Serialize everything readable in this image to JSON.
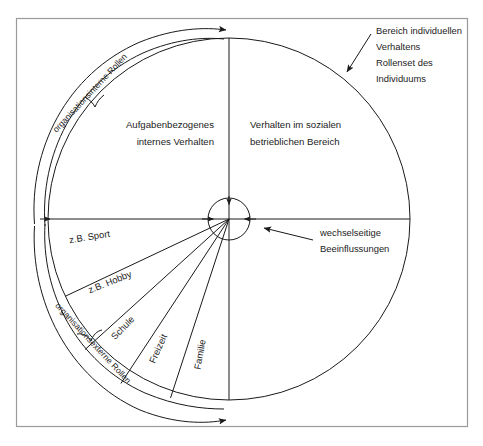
{
  "diagram": {
    "title_visible": false,
    "frame": {
      "present": true,
      "color": "#9a9a9a"
    },
    "line_color": "#1a1a1a",
    "background": "#ffffff",
    "quadrants": {
      "top_left": {
        "line1": "Aufgabenbezogenes",
        "line2": "internes Verhalten"
      },
      "top_right": {
        "line1": "Verhalten im sozialen",
        "line2": "betrieblichen Bereich"
      }
    },
    "callout_individual": {
      "line1": "Bereich individuellen",
      "line2": "Verhaltens",
      "line3": "Rollenset des",
      "line4": "Individuums"
    },
    "callout_center": {
      "line1": "wechselseitige",
      "line2": "Beeinflussungen"
    },
    "arc_brackets": [
      {
        "id": "internal",
        "label": "organisationsinterne Rollen"
      },
      {
        "id": "external",
        "label": "organisationsexterne Rollen"
      }
    ],
    "segments": [
      {
        "label": "z.B. Sport"
      },
      {
        "label": "z.B. Hobby"
      },
      {
        "label": "Schule"
      },
      {
        "label": "Freizeit"
      },
      {
        "label": "Familie"
      }
    ]
  }
}
